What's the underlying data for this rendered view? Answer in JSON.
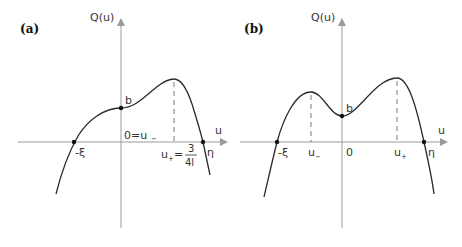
{
  "figure": {
    "panel_a": {
      "label": "(a)",
      "y_axis_label": "Q(u)",
      "x_axis_label": "u",
      "point_b": "b",
      "left_root": "-ξ",
      "right_root": "η",
      "origin_label": "0=u",
      "origin_sub": "−",
      "u_plus_label": "u",
      "u_plus_sub": "+",
      "u_plus_eq": "=",
      "frac_num": "3",
      "frac_den": "4l"
    },
    "panel_b": {
      "label": "(b)",
      "y_axis_label": "Q(u)",
      "x_axis_label": "u",
      "point_b": "b",
      "left_root": "-ξ",
      "right_root": "η",
      "origin_label": "0",
      "u_minus_label": "u",
      "u_minus_sub": "−",
      "u_plus_label": "u",
      "u_plus_sub": "+"
    },
    "colors": {
      "axis": "#9a9a9a",
      "curve": "#2a2a2a",
      "text": "#333333"
    }
  }
}
